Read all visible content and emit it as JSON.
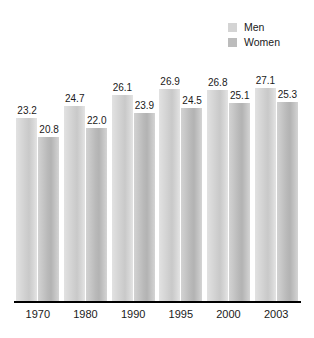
{
  "chart_data": {
    "type": "bar",
    "title": "",
    "subtitle": "",
    "xlabel": "",
    "ylabel": "",
    "categories": [
      "1970",
      "1980",
      "1990",
      "1995",
      "2000",
      "2003"
    ],
    "series": [
      {
        "name": "Men",
        "color": "#d4d4d4",
        "values": [
          23.2,
          24.7,
          26.1,
          26.9,
          26.8,
          27.1
        ]
      },
      {
        "name": "Women",
        "color": "#bcbcbc",
        "values": [
          20.8,
          22.0,
          23.9,
          24.5,
          25.1,
          25.3
        ]
      }
    ],
    "value_labels": {
      "Men": [
        "23.2",
        "24.7",
        "26.1",
        "26.9",
        "26.8",
        "27.1"
      ],
      "Women": [
        "20.8",
        "22.0",
        "23.9",
        "24.5",
        "25.1",
        "25.3"
      ]
    },
    "ylim": [
      0,
      30.6
    ],
    "grid": false,
    "legend_position": "top-right",
    "axis_color": "#000000"
  },
  "legend": {
    "items": [
      {
        "label": "Men",
        "color": "#d4d4d4"
      },
      {
        "label": "Women",
        "color": "#bcbcbc"
      }
    ]
  }
}
